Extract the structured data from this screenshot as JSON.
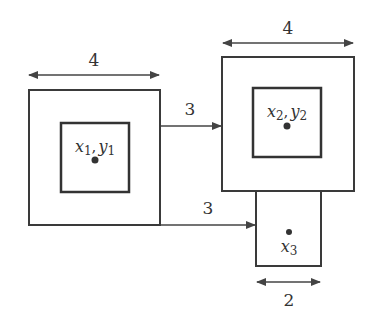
{
  "diagram": {
    "title": "",
    "colors": {
      "stroke": "#3a3a3a",
      "background": "#ffffff"
    },
    "modules": [
      {
        "id": "module1",
        "outer_width_label": "4",
        "center_label": {
          "var1": "x",
          "sub1": "1",
          "sep": ",",
          "var2": "y",
          "sub2": "1"
        }
      },
      {
        "id": "module2",
        "outer_width_label": "4",
        "center_label": {
          "var1": "x",
          "sub1": "2",
          "sep": ",",
          "var2": "y",
          "sub2": "2"
        }
      },
      {
        "id": "module3",
        "width_label": "2",
        "center_label": {
          "var1": "x",
          "sub1": "3"
        }
      }
    ],
    "connections": [
      {
        "from": "module1",
        "to": "module2",
        "label": "3"
      },
      {
        "from": "module1",
        "to": "module3",
        "label": "3"
      }
    ]
  }
}
